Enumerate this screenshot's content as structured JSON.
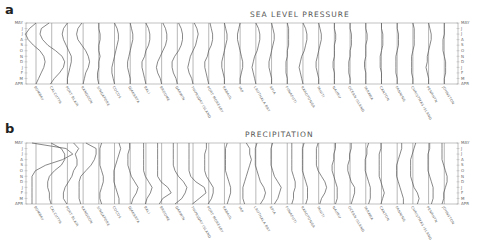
{
  "chart_data": [
    {
      "type": "line",
      "panel": "a",
      "title": "SEA LEVEL PRESSURE",
      "ylabel_top": "MAY",
      "ylabel_bottom": "APR",
      "y_ticks": [
        "MAY",
        "J",
        "J",
        "A",
        "S",
        "O",
        "N",
        "D",
        "J",
        "F",
        "M",
        "APR"
      ],
      "stations": [
        "BOMBAY",
        "CALCUTTA",
        "PORT BLAIR",
        "RANGOON",
        "SINGAPORE",
        "COCOS",
        "DJAKARTA",
        "BALI",
        "BROOME",
        "DARWIN",
        "THURSDAY ISLAND",
        "PORT MORESBY",
        "RABAUL",
        "YAP",
        "LAUTHALA BAY",
        "APIA",
        "FUNAFUTI",
        "RAROTONGA",
        "TAHITI",
        "NAURU",
        "OCEAN ISLAND",
        "TARAWA",
        "CANTON",
        "FANNING",
        "CHRISTMAS ISLAND",
        "PENRHYN",
        "JOHNSTON"
      ],
      "series_note": "Each station has a vertical monthly profile (May top to April bottom); values are relative offsets from station baseline",
      "series": [
        {
          "name": "BOMBAY",
          "values": [
            0,
            -5,
            -8,
            -6,
            -2,
            3,
            6,
            7,
            6,
            4,
            2,
            0
          ]
        },
        {
          "name": "CALCUTTA",
          "values": [
            -2,
            -8,
            -9,
            -7,
            -3,
            3,
            8,
            10,
            9,
            6,
            2,
            -1
          ]
        },
        {
          "name": "PORT BLAIR",
          "values": [
            0,
            -3,
            -4,
            -3,
            -1,
            1,
            3,
            3,
            2,
            1,
            0,
            0
          ]
        },
        {
          "name": "RANGOON",
          "values": [
            -1,
            -4,
            -5,
            -4,
            -1,
            2,
            4,
            5,
            4,
            2,
            1,
            0
          ]
        },
        {
          "name": "SINGAPORE",
          "values": [
            0,
            0,
            1,
            1,
            0,
            0,
            1,
            0,
            0,
            -1,
            -1,
            0
          ]
        },
        {
          "name": "COCOS",
          "values": [
            0,
            2,
            3,
            3,
            2,
            1,
            0,
            -1,
            -2,
            -2,
            -1,
            0
          ]
        },
        {
          "name": "DJAKARTA",
          "values": [
            0,
            1,
            2,
            2,
            1,
            0,
            -1,
            -2,
            -2,
            -1,
            0,
            0
          ]
        },
        {
          "name": "BALI",
          "values": [
            0,
            2,
            3,
            3,
            2,
            0,
            -1,
            -3,
            -3,
            -2,
            -1,
            0
          ]
        },
        {
          "name": "BROOME",
          "values": [
            1,
            3,
            4,
            4,
            3,
            1,
            -1,
            -3,
            -4,
            -3,
            -1,
            0
          ]
        },
        {
          "name": "DARWIN",
          "values": [
            1,
            3,
            4,
            4,
            3,
            1,
            -2,
            -4,
            -4,
            -3,
            -1,
            0
          ]
        },
        {
          "name": "THURSDAY ISLAND",
          "values": [
            1,
            3,
            4,
            3,
            2,
            0,
            -2,
            -3,
            -4,
            -3,
            -1,
            0
          ]
        },
        {
          "name": "PORT MORESBY",
          "values": [
            1,
            2,
            3,
            3,
            2,
            0,
            -1,
            -3,
            -3,
            -2,
            -1,
            0
          ]
        },
        {
          "name": "RABAUL",
          "values": [
            0,
            1,
            2,
            2,
            1,
            0,
            -1,
            -2,
            -2,
            -1,
            0,
            0
          ]
        },
        {
          "name": "YAP",
          "values": [
            0,
            -1,
            -2,
            -2,
            -1,
            0,
            1,
            2,
            2,
            1,
            0,
            0
          ]
        },
        {
          "name": "LAUTHALA BAY",
          "values": [
            0,
            2,
            3,
            3,
            2,
            1,
            -1,
            -2,
            -3,
            -2,
            -1,
            0
          ]
        },
        {
          "name": "APIA",
          "values": [
            0,
            1,
            2,
            2,
            1,
            0,
            -1,
            -2,
            -2,
            -1,
            0,
            0
          ]
        },
        {
          "name": "FUNAFUTI",
          "values": [
            0,
            1,
            1,
            1,
            1,
            0,
            0,
            -1,
            -1,
            -1,
            0,
            0
          ]
        },
        {
          "name": "RAROTONGA",
          "values": [
            0,
            2,
            3,
            3,
            2,
            1,
            -1,
            -2,
            -3,
            -2,
            -1,
            0
          ]
        },
        {
          "name": "TAHITI",
          "values": [
            0,
            1,
            2,
            2,
            1,
            0,
            -1,
            -2,
            -2,
            -1,
            0,
            0
          ]
        },
        {
          "name": "NAURU",
          "values": [
            0,
            0,
            1,
            1,
            0,
            0,
            0,
            -1,
            -1,
            0,
            0,
            0
          ]
        },
        {
          "name": "OCEAN ISLAND",
          "values": [
            0,
            0,
            1,
            1,
            1,
            0,
            0,
            -1,
            -1,
            -1,
            0,
            0
          ]
        },
        {
          "name": "TARAWA",
          "values": [
            0,
            0,
            1,
            1,
            0,
            0,
            0,
            -1,
            -1,
            0,
            0,
            0
          ]
        },
        {
          "name": "CANTON",
          "values": [
            0,
            0,
            1,
            1,
            1,
            0,
            -1,
            -1,
            -1,
            0,
            0,
            0
          ]
        },
        {
          "name": "FANNING",
          "values": [
            0,
            0,
            1,
            1,
            1,
            0,
            -1,
            -1,
            -1,
            -1,
            0,
            0
          ]
        },
        {
          "name": "CHRISTMAS ISLAND",
          "values": [
            0,
            1,
            1,
            1,
            1,
            0,
            -1,
            -1,
            -1,
            -1,
            0,
            0
          ]
        },
        {
          "name": "PENRHYN",
          "values": [
            0,
            1,
            2,
            2,
            1,
            0,
            -1,
            -1,
            -2,
            -1,
            0,
            0
          ]
        },
        {
          "name": "JOHNSTON",
          "values": [
            0,
            0,
            0,
            -1,
            -1,
            -1,
            0,
            1,
            1,
            1,
            0,
            0
          ]
        }
      ]
    },
    {
      "type": "line",
      "panel": "b",
      "title": "PRECIPITATION",
      "ylabel_top": "MAY",
      "ylabel_bottom": "APR",
      "y_ticks": [
        "MAY",
        "J",
        "J",
        "A",
        "S",
        "O",
        "N",
        "D",
        "J",
        "F",
        "M",
        "APR"
      ],
      "stations": [
        "BOMBAY",
        "CALCUTTA",
        "PORT BLAIR",
        "RANGOON",
        "SINGAPORE",
        "COCOS",
        "DJAKARTA",
        "BALI",
        "BROOME",
        "DARWIN",
        "THURSDAY ISLAND",
        "PORT MORESBY",
        "RABAUL",
        "YAP",
        "LAUTHALA BAY",
        "APIA",
        "FUNAFUTI",
        "RAROTONGA",
        "TAHITI",
        "NAURU",
        "OCEAN ISLAND",
        "TARAWA",
        "CANTON",
        "FANNING",
        "CHRISTMAS ISLAND",
        "PENRHYN",
        "JOHNSTON"
      ],
      "series_note": "Monthly precipitation profiles, offset per station; rightward = wetter",
      "series": [
        {
          "name": "BOMBAY",
          "values": [
            0,
            20,
            24,
            18,
            8,
            2,
            0,
            0,
            0,
            0,
            0,
            0
          ]
        },
        {
          "name": "CALCUTTA",
          "values": [
            2,
            8,
            10,
            10,
            8,
            4,
            1,
            0,
            0,
            1,
            1,
            2
          ]
        },
        {
          "name": "PORT BLAIR",
          "values": [
            6,
            9,
            7,
            8,
            8,
            6,
            5,
            3,
            1,
            0,
            0,
            2
          ]
        },
        {
          "name": "RANGOON",
          "values": [
            4,
            10,
            10,
            9,
            7,
            4,
            1,
            0,
            0,
            0,
            0,
            1
          ]
        },
        {
          "name": "SINGAPORE",
          "values": [
            4,
            3,
            3,
            3,
            3,
            4,
            5,
            5,
            4,
            3,
            3,
            4
          ]
        },
        {
          "name": "COCOS",
          "values": [
            5,
            6,
            5,
            4,
            3,
            2,
            2,
            2,
            3,
            4,
            5,
            5
          ]
        },
        {
          "name": "DJAKARTA",
          "values": [
            2,
            2,
            1,
            1,
            1,
            2,
            3,
            5,
            7,
            6,
            4,
            3
          ]
        },
        {
          "name": "BALI",
          "values": [
            1,
            1,
            1,
            1,
            1,
            1,
            2,
            4,
            6,
            5,
            3,
            2
          ]
        },
        {
          "name": "BROOME",
          "values": [
            0,
            0,
            0,
            0,
            0,
            0,
            0,
            2,
            6,
            8,
            3,
            1
          ]
        },
        {
          "name": "DARWIN",
          "values": [
            0,
            0,
            0,
            0,
            0,
            1,
            3,
            6,
            8,
            7,
            5,
            1
          ]
        },
        {
          "name": "THURSDAY ISLAND",
          "values": [
            0,
            0,
            0,
            0,
            0,
            0,
            1,
            4,
            9,
            10,
            6,
            2
          ]
        },
        {
          "name": "PORT MORESBY",
          "values": [
            1,
            1,
            0,
            0,
            0,
            0,
            1,
            3,
            5,
            5,
            4,
            2
          ]
        },
        {
          "name": "RABAUL",
          "values": [
            4,
            3,
            3,
            3,
            3,
            3,
            4,
            5,
            6,
            6,
            5,
            4
          ]
        },
        {
          "name": "YAP",
          "values": [
            6,
            8,
            8,
            9,
            8,
            7,
            6,
            5,
            4,
            4,
            4,
            5
          ]
        },
        {
          "name": "LAUTHALA BAY",
          "values": [
            3,
            2,
            2,
            2,
            2,
            3,
            4,
            5,
            7,
            8,
            7,
            5
          ]
        },
        {
          "name": "APIA",
          "values": [
            3,
            2,
            2,
            2,
            2,
            3,
            4,
            6,
            8,
            7,
            6,
            4
          ]
        },
        {
          "name": "FUNAFUTI",
          "values": [
            5,
            5,
            5,
            5,
            5,
            5,
            6,
            7,
            7,
            6,
            6,
            5
          ]
        },
        {
          "name": "RAROTONGA",
          "values": [
            3,
            2,
            2,
            2,
            2,
            2,
            3,
            4,
            5,
            5,
            5,
            4
          ]
        },
        {
          "name": "TAHITI",
          "values": [
            2,
            1,
            1,
            1,
            1,
            2,
            4,
            6,
            7,
            6,
            4,
            3
          ]
        },
        {
          "name": "NAURU",
          "values": [
            3,
            3,
            2,
            2,
            1,
            1,
            2,
            3,
            4,
            4,
            4,
            3
          ]
        },
        {
          "name": "OCEAN ISLAND",
          "values": [
            3,
            3,
            2,
            2,
            1,
            1,
            2,
            3,
            5,
            5,
            4,
            3
          ]
        },
        {
          "name": "TARAWA",
          "values": [
            4,
            3,
            3,
            2,
            2,
            2,
            3,
            4,
            5,
            5,
            5,
            4
          ]
        },
        {
          "name": "CANTON",
          "values": [
            2,
            2,
            1,
            1,
            1,
            1,
            1,
            2,
            3,
            4,
            3,
            2
          ]
        },
        {
          "name": "FANNING",
          "values": [
            5,
            5,
            4,
            3,
            2,
            2,
            2,
            3,
            4,
            5,
            6,
            6
          ]
        },
        {
          "name": "CHRISTMAS ISLAND",
          "values": [
            4,
            3,
            2,
            1,
            1,
            1,
            1,
            2,
            3,
            5,
            6,
            5
          ]
        },
        {
          "name": "PENRHYN",
          "values": [
            3,
            3,
            2,
            2,
            2,
            2,
            3,
            4,
            5,
            5,
            5,
            4
          ]
        },
        {
          "name": "JOHNSTON",
          "values": [
            1,
            1,
            1,
            1,
            2,
            3,
            4,
            4,
            3,
            2,
            2,
            1
          ]
        }
      ]
    }
  ],
  "panels": {
    "a": {
      "letter": "a",
      "title": "SEA LEVEL PRESSURE"
    },
    "b": {
      "letter": "b",
      "title": "PRECIPITATION"
    }
  },
  "axis": {
    "top": "MAY",
    "bottom": "APR",
    "mid_ticks": [
      "J",
      "J",
      "A",
      "S",
      "O",
      "N",
      "D",
      "J",
      "F",
      "M"
    ]
  }
}
